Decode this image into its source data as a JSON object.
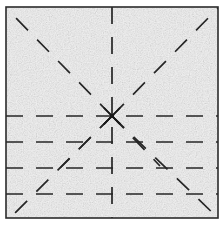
{
  "figure": {
    "canvas": {
      "width": 223,
      "height": 225
    },
    "background_color": "#ffffff",
    "paper": {
      "label": "sheet",
      "fill_color": "#f2f2f2",
      "speckle_color": "#d8d8d8",
      "border_color": "#2b2b2b",
      "border_width": 1.6,
      "x": 6,
      "y": 7,
      "width": 212,
      "height": 211
    },
    "center_point": {
      "label": "fold convergence point",
      "x": 112,
      "y": 116,
      "marker_color": "#1a1a1a",
      "marker_radius": 2.2
    },
    "line_style": {
      "color": "#262626",
      "width": 1.7,
      "dash_length": 17,
      "gap_length": 13
    },
    "guide_lines": [
      {
        "name": "vertical-center-crease",
        "orientation": "vertical",
        "x1": 112,
        "y1": 7,
        "x2": 112,
        "y2": 218
      },
      {
        "name": "horizontal-crease-1",
        "orientation": "horizontal",
        "x1": 6,
        "y1": 116,
        "x2": 218,
        "y2": 116
      },
      {
        "name": "horizontal-crease-2",
        "orientation": "horizontal",
        "x1": 6,
        "y1": 142,
        "x2": 218,
        "y2": 142
      },
      {
        "name": "horizontal-crease-3",
        "orientation": "horizontal",
        "x1": 6,
        "y1": 168,
        "x2": 218,
        "y2": 168
      },
      {
        "name": "horizontal-crease-4",
        "orientation": "horizontal",
        "x1": 6,
        "y1": 194,
        "x2": 218,
        "y2": 194
      }
    ],
    "radial_lines": [
      {
        "name": "ray-upper-left",
        "angle_deg": 225,
        "x1": 112,
        "y1": 116,
        "x2": 12,
        "y2": 14
      },
      {
        "name": "ray-upper-right",
        "angle_deg": 315,
        "x1": 112,
        "y1": 116,
        "x2": 218,
        "y2": 8
      },
      {
        "name": "ray-lower-left",
        "angle_deg": 135,
        "x1": 112,
        "y1": 116,
        "x2": 12,
        "y2": 216
      },
      {
        "name": "ray-lower-right-near",
        "angle_deg": 45,
        "x1": 112,
        "y1": 116,
        "x2": 218,
        "y2": 218
      },
      {
        "name": "ray-lower-left-short",
        "angle_deg": 135,
        "x1": 112,
        "y1": 116,
        "x2": 60,
        "y2": 168
      },
      {
        "name": "ray-lower-right-short",
        "angle_deg": 45,
        "x1": 112,
        "y1": 116,
        "x2": 160,
        "y2": 166
      }
    ]
  }
}
